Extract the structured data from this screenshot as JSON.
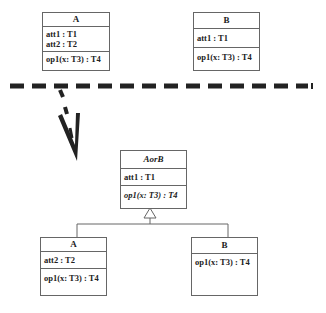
{
  "top": {
    "classA": {
      "name": "A",
      "attributes": [
        "att1 : T1",
        "att2 : T2"
      ],
      "operations": [
        "op1(x: T3) : T4"
      ]
    },
    "classB": {
      "name": "B",
      "attributes": [
        "att1 : T1"
      ],
      "operations": [
        "op1(x: T3) : T4"
      ]
    }
  },
  "bottom": {
    "superclass": {
      "name": "AorB",
      "attributes": [
        "att1 : T1"
      ],
      "operations": [
        "op1(x: T3) : T4"
      ]
    },
    "classA": {
      "name": "A",
      "attributes": [
        "att2 : T2"
      ],
      "operations": [
        "op1(x: T3) : T4"
      ]
    },
    "classB": {
      "name": "B",
      "operations": [
        "op1(x: T3) : T4"
      ]
    }
  },
  "colors": {
    "line": "#666666",
    "separator": "#222222"
  }
}
